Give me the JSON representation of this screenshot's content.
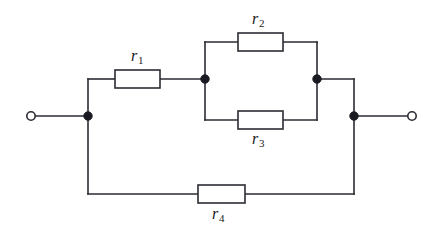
{
  "diagram": {
    "type": "electrical-schematic",
    "background_color": "#ffffff",
    "line_color": "#2b2b33",
    "node_color": "#1a1a22"
  },
  "components": {
    "r1": {
      "label": "r",
      "subscript": "1",
      "kind": "resistor"
    },
    "r2": {
      "label": "r",
      "subscript": "2",
      "kind": "resistor"
    },
    "r3": {
      "label": "r",
      "subscript": "3",
      "kind": "resistor"
    },
    "r4": {
      "label": "r",
      "subscript": "4",
      "kind": "resistor"
    }
  },
  "terminals": {
    "left": {
      "kind": "open-terminal"
    },
    "right": {
      "kind": "open-terminal"
    }
  },
  "junctions": [
    {
      "name": "left-junction"
    },
    {
      "name": "mid-left-junction"
    },
    {
      "name": "mid-right-junction"
    },
    {
      "name": "right-junction"
    }
  ]
}
